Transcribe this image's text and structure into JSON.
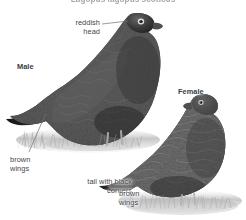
{
  "plate": {
    "title": "Red Grouse — male and female",
    "medium": "black-and-white photographic plate",
    "background_color": "#ffffff",
    "width": 246,
    "height": 220
  },
  "caption": {
    "text": "Lagopus lagopus scoticus",
    "note": "clipped by the top edge of the frame; only the lower pixel row of the glyphs is visible"
  },
  "labels": {
    "male": "Male",
    "female": "Female",
    "reddish_head_line1": "reddish",
    "reddish_head_line2": "head",
    "brown_wings_left_line1": "brown",
    "brown_wings_left_line2": "wings",
    "tail_line1": "tail with black",
    "tail_line2": "corners",
    "brown_wings_right_line1": "brown",
    "brown_wings_right_line2": "wings"
  },
  "colors": {
    "label_text": "#44464a",
    "leader_line": "#6e7074",
    "plumage_dark": "#2d2a28",
    "plumage_mid": "#56504b",
    "plumage_light": "#8d857e",
    "ground": "#b9b4ae",
    "background": "#ffffff"
  },
  "subjects": [
    {
      "name": "male-red-grouse",
      "position": "left",
      "facing": "right",
      "traits": [
        "reddish head",
        "brown wings",
        "tail with black corners"
      ]
    },
    {
      "name": "female-red-grouse",
      "position": "right",
      "facing": "left",
      "traits": [
        "brown wings",
        "heavily barred mottled plumage"
      ]
    }
  ]
}
